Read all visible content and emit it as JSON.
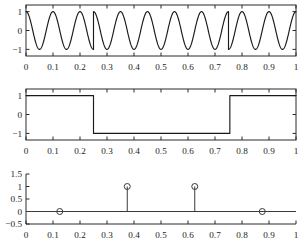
{
  "figure": {
    "title": "",
    "background": "#ffffff",
    "line_color": "#1a1a1a",
    "axis_color": "#2b2b2b"
  },
  "chart_data": [
    {
      "type": "line",
      "name": "bpsk-modulated-carrier",
      "title": "",
      "xlabel": "",
      "ylabel": "",
      "xlim": [
        0,
        1
      ],
      "ylim": [
        -1.35,
        1.35
      ],
      "grid": false,
      "legend": null,
      "xticks": [
        0,
        0.1,
        0.2,
        0.3,
        0.4,
        0.5,
        0.6,
        0.7,
        0.8,
        0.9,
        1
      ],
      "xticklabels": [
        "0",
        "0.1",
        "0.2",
        "0.3",
        "0.4",
        "0.5",
        "0.6",
        "0.7",
        "0.8",
        "0.9",
        "1"
      ],
      "yticks": [
        -1,
        0,
        1
      ],
      "yticklabels": [
        "-1",
        "0",
        "1"
      ],
      "description": "Sinusoidal carrier of 10 Hz amplitude 1 with 180-degree phase reversals at t=0.25 and t=0.75",
      "carrier_frequency_hz": 10,
      "amplitude": 1,
      "phase_flip_times": [
        0.25,
        0.75
      ],
      "series": [
        {
          "name": "s(t)",
          "formula": "d(t)*cos(2*pi*10*t)",
          "x": [
            0,
            0.25,
            0.25,
            0.75,
            0.75,
            1
          ],
          "segments": [
            {
              "t_start": 0,
              "t_end": 0.25,
              "sign": 1
            },
            {
              "t_start": 0.25,
              "t_end": 0.75,
              "sign": -1
            },
            {
              "t_start": 0.75,
              "t_end": 1,
              "sign": 1
            }
          ]
        }
      ]
    },
    {
      "type": "line",
      "name": "data-square-wave",
      "title": "",
      "xlabel": "",
      "ylabel": "",
      "xlim": [
        0,
        1
      ],
      "ylim": [
        -1.35,
        1.35
      ],
      "grid": false,
      "legend": null,
      "xticks": [
        0,
        0.1,
        0.2,
        0.3,
        0.4,
        0.5,
        0.6,
        0.7,
        0.8,
        0.9,
        1
      ],
      "xticklabels": [
        "0",
        "0.1",
        "0.2",
        "0.3",
        "0.4",
        "0.5",
        "0.6",
        "0.7",
        "0.8",
        "0.9",
        "1"
      ],
      "yticks": [
        -1,
        0,
        1
      ],
      "yticklabels": [
        "-1",
        "0",
        "1"
      ],
      "description": "Bipolar NRZ data waveform: +1 for 0<=t<0.25, -1 for 0.25<=t<0.755, +1 for t>=0.755",
      "series": [
        {
          "name": "d(t)",
          "x": [
            0,
            0.25,
            0.25,
            0.755,
            0.755,
            1
          ],
          "y": [
            1,
            1,
            -1,
            -1,
            1,
            1
          ]
        }
      ]
    },
    {
      "type": "scatter",
      "name": "decoded-bit-stem-plot",
      "title": "",
      "xlabel": "",
      "ylabel": "",
      "xlim": [
        0,
        1
      ],
      "ylim": [
        -0.5,
        1.5
      ],
      "grid": false,
      "legend": null,
      "xticks": [
        0,
        0.1,
        0.2,
        0.3,
        0.4,
        0.5,
        0.6,
        0.7,
        0.8,
        0.9,
        1
      ],
      "xticklabels": [
        "0",
        "0.1",
        "0.2",
        "0.3",
        "0.4",
        "0.5",
        "0.6",
        "0.7",
        "0.8",
        "0.9",
        "1"
      ],
      "yticks": [
        -0.5,
        0,
        0.5,
        1,
        1.5
      ],
      "yticklabels": [
        "-0.5",
        "0",
        "0.5",
        "1",
        "1.5"
      ],
      "description": "Stem plot of recovered bits sampled at symbol centers; open circle markers on a zero baseline",
      "baseline": 0,
      "marker": "open-circle",
      "x": [
        0.125,
        0.375,
        0.625,
        0.875
      ],
      "values": [
        0,
        1,
        1,
        0
      ]
    }
  ]
}
